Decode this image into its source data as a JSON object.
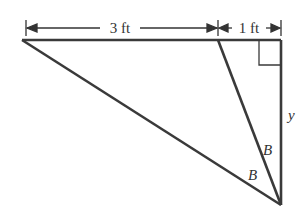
{
  "diagram": {
    "type": "geometry-triangle",
    "dimensions": {
      "left_segment_label": "3 ft",
      "right_segment_label": "1 ft"
    },
    "labels": {
      "side": "y",
      "angle_upper": "B",
      "angle_lower": "B"
    },
    "colors": {
      "stroke": "#3a3a3a",
      "background": "#ffffff"
    }
  }
}
